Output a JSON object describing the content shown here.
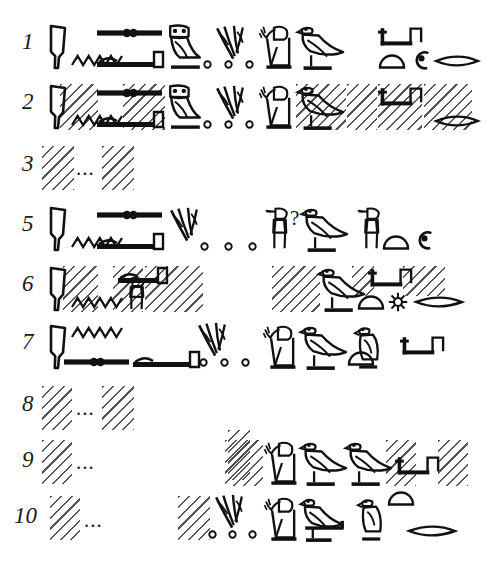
{
  "plate": {
    "title": "Hieroglyphic transcription plate",
    "description": "Epigraphic line-by-line hieroglyph copy with hatched lacunae",
    "ink_color": "#111111",
    "hatch_color": "#555555",
    "background": "#ffffff",
    "ellipsis": "...",
    "query_mark": "?"
  },
  "lines": [
    {
      "number": "1",
      "number_x": 22,
      "number_y": 30,
      "top": 18,
      "damaged": false,
      "glyphs": [
        {
          "name": "reed-knife-sign",
          "type": "knife",
          "x": 48,
          "y": 24,
          "w": 20,
          "h": 46
        },
        {
          "name": "water-ripple-sign",
          "type": "ripple",
          "x": 72,
          "y": 53,
          "w": 50,
          "h": 14
        },
        {
          "name": "beam-with-beads-sign",
          "type": "beadbar",
          "x": 97,
          "y": 27,
          "w": 65,
          "h": 12
        },
        {
          "name": "lasso-bar-sign",
          "type": "lassobar",
          "x": 97,
          "y": 50,
          "w": 67,
          "h": 20
        },
        {
          "name": "owl-sign",
          "type": "owl",
          "x": 163,
          "y": 24,
          "w": 40,
          "h": 46
        },
        {
          "name": "plural-dot-1",
          "type": "dot",
          "x": 203,
          "y": 60,
          "w": 9,
          "h": 9
        },
        {
          "name": "reed-cluster-sign",
          "type": "reeds",
          "x": 214,
          "y": 25,
          "w": 40,
          "h": 42
        },
        {
          "name": "plural-dot-2",
          "type": "dot",
          "x": 224,
          "y": 60,
          "w": 9,
          "h": 9
        },
        {
          "name": "plural-dot-3",
          "type": "dot",
          "x": 245,
          "y": 60,
          "w": 9,
          "h": 9
        },
        {
          "name": "adoring-man-sign",
          "type": "adorer",
          "x": 258,
          "y": 24,
          "w": 38,
          "h": 46
        },
        {
          "name": "falcon-sign",
          "type": "falcon",
          "x": 297,
          "y": 24,
          "w": 47,
          "h": 46
        },
        {
          "name": "folded-stand-sign",
          "type": "stand",
          "x": 378,
          "y": 27,
          "w": 44,
          "h": 20
        },
        {
          "name": "bread-loaf-sign",
          "type": "loaf",
          "x": 379,
          "y": 55,
          "w": 26,
          "h": 14
        },
        {
          "name": "coil-rope-sign",
          "type": "coil",
          "x": 412,
          "y": 50,
          "w": 19,
          "h": 20
        },
        {
          "name": "fish-mouth-sign",
          "type": "lens",
          "x": 435,
          "y": 54,
          "w": 44,
          "h": 14
        }
      ],
      "hatches": []
    },
    {
      "number": "2",
      "number_x": 22,
      "number_y": 90,
      "top": 78,
      "damaged": true,
      "glyphs": [
        {
          "name": "reed-knife-sign",
          "type": "knife",
          "x": 48,
          "y": 84,
          "w": 20,
          "h": 46
        },
        {
          "name": "water-ripple-sign",
          "type": "ripple",
          "x": 72,
          "y": 113,
          "w": 50,
          "h": 14
        },
        {
          "name": "beam-with-beads-sign",
          "type": "beadbar",
          "x": 97,
          "y": 87,
          "w": 65,
          "h": 12
        },
        {
          "name": "lasso-bar-sign",
          "type": "lassobar",
          "x": 97,
          "y": 110,
          "w": 67,
          "h": 20
        },
        {
          "name": "owl-sign",
          "type": "owl",
          "x": 163,
          "y": 84,
          "w": 40,
          "h": 46
        },
        {
          "name": "plural-dot-1",
          "type": "dot",
          "x": 203,
          "y": 120,
          "w": 9,
          "h": 9
        },
        {
          "name": "reed-cluster-sign",
          "type": "reeds",
          "x": 214,
          "y": 85,
          "w": 40,
          "h": 42
        },
        {
          "name": "plural-dot-2",
          "type": "dot",
          "x": 224,
          "y": 120,
          "w": 9,
          "h": 9
        },
        {
          "name": "plural-dot-3",
          "type": "dot",
          "x": 245,
          "y": 120,
          "w": 9,
          "h": 9
        },
        {
          "name": "adoring-man-sign",
          "type": "adorer",
          "x": 258,
          "y": 84,
          "w": 38,
          "h": 46
        },
        {
          "name": "falcon-sign",
          "type": "falcon",
          "x": 297,
          "y": 84,
          "w": 47,
          "h": 46
        },
        {
          "name": "folded-stand-sign",
          "type": "stand",
          "x": 378,
          "y": 87,
          "w": 44,
          "h": 20
        },
        {
          "name": "fish-mouth-sign",
          "type": "lens",
          "x": 435,
          "y": 114,
          "w": 44,
          "h": 14
        }
      ],
      "hatches": [
        {
          "name": "lacuna-block",
          "x": 60,
          "y": 84,
          "w": 38,
          "h": 46
        },
        {
          "name": "lacuna-block",
          "x": 123,
          "y": 84,
          "w": 42,
          "h": 46
        },
        {
          "name": "lacuna-block",
          "x": 296,
          "y": 84,
          "w": 50,
          "h": 46
        },
        {
          "name": "lacuna-block",
          "x": 347,
          "y": 84,
          "w": 30,
          "h": 46
        },
        {
          "name": "lacuna-block",
          "x": 378,
          "y": 84,
          "w": 44,
          "h": 46
        },
        {
          "name": "lacuna-block",
          "x": 424,
          "y": 84,
          "w": 48,
          "h": 46
        }
      ]
    },
    {
      "number": "3",
      "number_x": 22,
      "number_y": 152,
      "top": 140,
      "damaged": true,
      "ellipsis": {
        "x": 76,
        "y": 158
      },
      "glyphs": [],
      "hatches": [
        {
          "name": "lacuna-block",
          "x": 42,
          "y": 146,
          "w": 32,
          "h": 44
        },
        {
          "name": "lacuna-block",
          "x": 102,
          "y": 146,
          "w": 32,
          "h": 44
        }
      ]
    },
    {
      "number": "5",
      "number_x": 22,
      "number_y": 212,
      "top": 200,
      "damaged": false,
      "query": {
        "x": 290,
        "y": 208
      },
      "glyphs": [
        {
          "name": "reed-knife-sign",
          "type": "knife",
          "x": 48,
          "y": 206,
          "w": 20,
          "h": 46
        },
        {
          "name": "water-ripple-sign",
          "type": "ripple",
          "x": 72,
          "y": 235,
          "w": 50,
          "h": 14
        },
        {
          "name": "beam-with-beads-sign",
          "type": "beadbar",
          "x": 97,
          "y": 209,
          "w": 65,
          "h": 12
        },
        {
          "name": "lasso-bar-sign",
          "type": "lassobar",
          "x": 97,
          "y": 232,
          "w": 67,
          "h": 20
        },
        {
          "name": "reed-cluster-sign",
          "type": "reeds",
          "x": 168,
          "y": 207,
          "w": 40,
          "h": 42
        },
        {
          "name": "plural-dot-1",
          "type": "dot",
          "x": 200,
          "y": 242,
          "w": 9,
          "h": 9
        },
        {
          "name": "plural-dot-2",
          "type": "dot",
          "x": 224,
          "y": 242,
          "w": 9,
          "h": 9
        },
        {
          "name": "plural-dot-3",
          "type": "dot",
          "x": 248,
          "y": 242,
          "w": 9,
          "h": 9
        },
        {
          "name": "standing-offerer-sign",
          "type": "offerer",
          "x": 263,
          "y": 206,
          "w": 27,
          "h": 46
        },
        {
          "name": "falcon-sign",
          "type": "falcon",
          "x": 301,
          "y": 206,
          "w": 47,
          "h": 46
        },
        {
          "name": "standing-offerer-sign",
          "type": "offerer",
          "x": 355,
          "y": 206,
          "w": 27,
          "h": 46
        },
        {
          "name": "bread-loaf-sign",
          "type": "loaf",
          "x": 383,
          "y": 236,
          "w": 26,
          "h": 14
        },
        {
          "name": "coil-rope-sign",
          "type": "coil",
          "x": 415,
          "y": 230,
          "w": 19,
          "h": 20
        }
      ],
      "hatches": []
    },
    {
      "number": "6",
      "number_x": 22,
      "number_y": 272,
      "top": 260,
      "damaged": true,
      "glyphs": [
        {
          "name": "reed-knife-sign",
          "type": "knife",
          "x": 48,
          "y": 266,
          "w": 20,
          "h": 46
        },
        {
          "name": "water-ripple-sign",
          "type": "ripple",
          "x": 72,
          "y": 295,
          "w": 50,
          "h": 14
        },
        {
          "name": "lasso-bar-sign",
          "type": "lassobar",
          "x": 118,
          "y": 266,
          "w": 50,
          "h": 20
        },
        {
          "name": "standing-figure-sign",
          "type": "offerer",
          "x": 120,
          "y": 276,
          "w": 27,
          "h": 36
        },
        {
          "name": "falcon-sign",
          "type": "falcon",
          "x": 318,
          "y": 266,
          "w": 47,
          "h": 46
        },
        {
          "name": "folded-stand-sign",
          "type": "stand",
          "x": 368,
          "y": 268,
          "w": 44,
          "h": 20
        },
        {
          "name": "bread-loaf-sign",
          "type": "loaf",
          "x": 358,
          "y": 296,
          "w": 26,
          "h": 14
        },
        {
          "name": "rosette-sign",
          "type": "rosette",
          "x": 388,
          "y": 292,
          "w": 20,
          "h": 20
        },
        {
          "name": "fish-mouth-sign",
          "type": "lens",
          "x": 415,
          "y": 295,
          "w": 48,
          "h": 14
        }
      ],
      "hatches": [
        {
          "name": "lacuna-block",
          "x": 63,
          "y": 266,
          "w": 35,
          "h": 46
        },
        {
          "name": "lacuna-block",
          "x": 113,
          "y": 266,
          "w": 30,
          "h": 46
        },
        {
          "name": "lacuna-block",
          "x": 145,
          "y": 266,
          "w": 58,
          "h": 46
        },
        {
          "name": "lacuna-block",
          "x": 272,
          "y": 266,
          "w": 48,
          "h": 46
        },
        {
          "name": "lacuna-block",
          "x": 352,
          "y": 266,
          "w": 22,
          "h": 30
        },
        {
          "name": "lacuna-block",
          "x": 403,
          "y": 266,
          "w": 42,
          "h": 30
        }
      ]
    },
    {
      "number": "7",
      "number_x": 22,
      "number_y": 330,
      "top": 318,
      "damaged": false,
      "glyphs": [
        {
          "name": "reed-knife-sign",
          "type": "knife",
          "x": 48,
          "y": 324,
          "w": 20,
          "h": 46
        },
        {
          "name": "water-ripple-sign",
          "type": "ripple",
          "x": 72,
          "y": 325,
          "w": 50,
          "h": 14
        },
        {
          "name": "beam-with-beads-sign",
          "type": "beadbar",
          "x": 64,
          "y": 356,
          "w": 65,
          "h": 12
        },
        {
          "name": "lasso-bar-sign",
          "type": "lassobar",
          "x": 133,
          "y": 350,
          "w": 67,
          "h": 20
        },
        {
          "name": "reed-cluster-sign",
          "type": "reeds",
          "x": 196,
          "y": 322,
          "w": 40,
          "h": 42
        },
        {
          "name": "plural-dot-1",
          "type": "dot",
          "x": 199,
          "y": 358,
          "w": 9,
          "h": 9
        },
        {
          "name": "plural-dot-2",
          "type": "dot",
          "x": 220,
          "y": 358,
          "w": 9,
          "h": 9
        },
        {
          "name": "plural-dot-3",
          "type": "dot",
          "x": 241,
          "y": 358,
          "w": 9,
          "h": 9
        },
        {
          "name": "adoring-man-sign",
          "type": "adorer",
          "x": 262,
          "y": 324,
          "w": 38,
          "h": 46
        },
        {
          "name": "falcon-sign",
          "type": "falcon",
          "x": 300,
          "y": 324,
          "w": 47,
          "h": 46
        },
        {
          "name": "bread-loaf-sign",
          "type": "loaf",
          "x": 348,
          "y": 352,
          "w": 26,
          "h": 14
        },
        {
          "name": "bird-standing-sign",
          "type": "birdsmall",
          "x": 352,
          "y": 324,
          "w": 36,
          "h": 46
        },
        {
          "name": "folded-stand-sign",
          "type": "stand",
          "x": 400,
          "y": 336,
          "w": 44,
          "h": 20
        }
      ],
      "hatches": []
    },
    {
      "number": "8",
      "number_x": 22,
      "number_y": 392,
      "top": 380,
      "damaged": true,
      "ellipsis": {
        "x": 76,
        "y": 398
      },
      "glyphs": [],
      "hatches": [
        {
          "name": "lacuna-block",
          "x": 42,
          "y": 386,
          "w": 30,
          "h": 44
        },
        {
          "name": "lacuna-block",
          "x": 102,
          "y": 386,
          "w": 32,
          "h": 44
        }
      ]
    },
    {
      "number": "9",
      "number_x": 22,
      "number_y": 448,
      "top": 436,
      "damaged": true,
      "ellipsis": {
        "x": 76,
        "y": 452
      },
      "glyphs": [
        {
          "name": "adoring-man-sign",
          "type": "adorer",
          "x": 263,
          "y": 440,
          "w": 38,
          "h": 46
        },
        {
          "name": "falcon-sign",
          "type": "falcon",
          "x": 300,
          "y": 440,
          "w": 47,
          "h": 46
        },
        {
          "name": "falcon-sign",
          "type": "falcon",
          "x": 345,
          "y": 440,
          "w": 47,
          "h": 46
        },
        {
          "name": "folded-stand-sign",
          "type": "stand",
          "x": 395,
          "y": 456,
          "w": 44,
          "h": 20
        }
      ],
      "hatches": [
        {
          "name": "lacuna-block",
          "x": 42,
          "y": 440,
          "w": 30,
          "h": 44
        },
        {
          "name": "lacuna-block",
          "x": 228,
          "y": 430,
          "w": 22,
          "h": 50
        },
        {
          "name": "lacuna-block",
          "x": 225,
          "y": 440,
          "w": 38,
          "h": 46
        },
        {
          "name": "lacuna-block",
          "x": 386,
          "y": 440,
          "w": 30,
          "h": 46
        },
        {
          "name": "lacuna-block",
          "x": 438,
          "y": 440,
          "w": 30,
          "h": 46
        }
      ]
    },
    {
      "number": "10",
      "number_x": 14,
      "number_y": 504,
      "top": 492,
      "damaged": true,
      "ellipsis": {
        "x": 84,
        "y": 510
      },
      "glyphs": [
        {
          "name": "reed-cluster-sign",
          "type": "reeds",
          "x": 213,
          "y": 494,
          "w": 40,
          "h": 42
        },
        {
          "name": "plural-dot-1",
          "type": "dot",
          "x": 208,
          "y": 530,
          "w": 9,
          "h": 9
        },
        {
          "name": "plural-dot-2",
          "type": "dot",
          "x": 228,
          "y": 530,
          "w": 9,
          "h": 9
        },
        {
          "name": "plural-dot-3",
          "type": "dot",
          "x": 248,
          "y": 530,
          "w": 9,
          "h": 9
        },
        {
          "name": "adoring-man-sign",
          "type": "adorer",
          "x": 263,
          "y": 496,
          "w": 38,
          "h": 46
        },
        {
          "name": "falcon-on-perch-sign",
          "type": "falconperch",
          "x": 300,
          "y": 496,
          "w": 52,
          "h": 46
        },
        {
          "name": "bird-standing-sign",
          "type": "birdsmall",
          "x": 355,
          "y": 496,
          "w": 36,
          "h": 46
        },
        {
          "name": "bread-loaf-sign",
          "type": "loaf",
          "x": 388,
          "y": 492,
          "w": 26,
          "h": 14
        },
        {
          "name": "fish-mouth-sign",
          "type": "lens",
          "x": 408,
          "y": 524,
          "w": 48,
          "h": 14
        }
      ],
      "hatches": [
        {
          "name": "lacuna-block",
          "x": 50,
          "y": 496,
          "w": 30,
          "h": 44
        },
        {
          "name": "lacuna-block",
          "x": 178,
          "y": 496,
          "w": 32,
          "h": 44
        }
      ]
    }
  ]
}
